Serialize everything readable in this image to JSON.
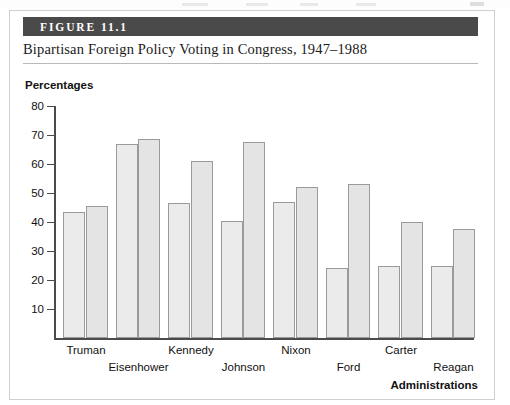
{
  "figure": {
    "number_label": "FIGURE 11.1",
    "title": "Bipartisan Foreign Policy Voting in Congress, 1947–1988"
  },
  "chart_data": {
    "type": "bar",
    "title": "Bipartisan Foreign Policy Voting in Congress, 1947–1988",
    "xlabel": "Administrations",
    "ylabel": "Percentages",
    "ylim": [
      0,
      80
    ],
    "yticks": [
      10,
      20,
      30,
      40,
      50,
      60,
      70,
      80
    ],
    "grid": false,
    "legend": "none",
    "categories": [
      "Truman",
      "Eisenhower",
      "Kennedy",
      "Johnson",
      "Nixon",
      "Ford",
      "Carter",
      "Reagan"
    ],
    "series": [
      {
        "name": "bar-1",
        "values": [
          43.5,
          67.0,
          46.5,
          40.5,
          47.0,
          24.0,
          25.0,
          25.0
        ]
      },
      {
        "name": "bar-2",
        "values": [
          45.5,
          68.5,
          61.0,
          67.5,
          52.0,
          53.0,
          40.0,
          37.5
        ]
      }
    ]
  },
  "colors": {
    "banner": "#4a4a4a",
    "bar_fill": "#ebebeb",
    "bar_border": "#9a9a9a",
    "axis": "#4b4b4b",
    "text": "#111111"
  }
}
